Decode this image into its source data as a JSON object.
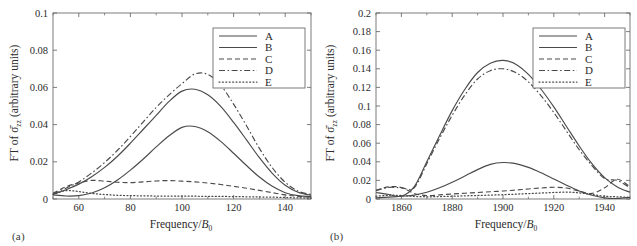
{
  "figure": {
    "background": "#ffffff",
    "line_color": "#4a4a4a",
    "axis_color": "#6e6e6e",
    "panels": [
      "a",
      "b"
    ]
  },
  "panel_a": {
    "caption": "(a)",
    "xlabel_main": "Frequency/",
    "xlabel_var": "B",
    "xlabel_sub": "0",
    "ylabel_prefix": "FT of ",
    "ylabel_sigma": "σ̄",
    "ylabel_sub": "zz",
    "ylabel_suffix": " (arbitrary units)",
    "xticks": [
      "60",
      "80",
      "100",
      "120",
      "140"
    ],
    "xtick_values": [
      60,
      80,
      100,
      120,
      140
    ],
    "yticks": [
      "0",
      "0.02",
      "0.04",
      "0.06",
      "0.08",
      "0.1"
    ],
    "ytick_values": [
      0,
      0.02,
      0.04,
      0.06,
      0.08,
      0.1
    ],
    "legend": [
      {
        "label": "A",
        "style": "solid"
      },
      {
        "label": "B",
        "style": "solid"
      },
      {
        "label": "C",
        "style": "dashed"
      },
      {
        "label": "D",
        "style": "dashdot"
      },
      {
        "label": "E",
        "style": "dotted"
      }
    ]
  },
  "panel_b": {
    "caption": "(b)",
    "xlabel_main": "Frequency/",
    "xlabel_var": "B",
    "xlabel_sub": "0",
    "ylabel_prefix": "FT of ",
    "ylabel_sigma": "σ̄",
    "ylabel_sub": "zz",
    "ylabel_suffix": " (arbitrary units)",
    "xticks": [
      "1860",
      "1880",
      "1900",
      "1920",
      "1940"
    ],
    "xtick_values": [
      1860,
      1880,
      1900,
      1920,
      1940
    ],
    "yticks": [
      "0",
      "0.02",
      "0.04",
      "0.06",
      "0.08",
      "0.1",
      "0.12",
      "0.14",
      "0.16",
      "0.18",
      "0.2"
    ],
    "ytick_values": [
      0,
      0.02,
      0.04,
      0.06,
      0.08,
      0.1,
      0.12,
      0.14,
      0.16,
      0.18,
      0.2
    ],
    "legend": [
      {
        "label": "A",
        "style": "solid"
      },
      {
        "label": "B",
        "style": "solid"
      },
      {
        "label": "C",
        "style": "dashed"
      },
      {
        "label": "D",
        "style": "dashdot"
      },
      {
        "label": "E",
        "style": "dotted"
      }
    ]
  },
  "chart_data": [
    {
      "type": "line",
      "panel": "a",
      "title": "",
      "xlabel": "Frequency/B0",
      "ylabel": "FT of σ̄zz (arbitrary units)",
      "xlim": [
        50,
        150
      ],
      "ylim": [
        0,
        0.1
      ],
      "grid": false,
      "legend_position": "top-right",
      "x": [
        50,
        55,
        60,
        65,
        70,
        75,
        80,
        85,
        90,
        95,
        100,
        105,
        110,
        115,
        120,
        125,
        130,
        135,
        140,
        145,
        150
      ],
      "series": [
        {
          "name": "A",
          "style": "solid",
          "values": [
            0.0022,
            0.0016,
            0.0018,
            0.0032,
            0.006,
            0.0102,
            0.0155,
            0.0215,
            0.028,
            0.034,
            0.0385,
            0.039,
            0.0362,
            0.031,
            0.0246,
            0.018,
            0.0118,
            0.0068,
            0.0034,
            0.0018,
            0.0014
          ]
        },
        {
          "name": "B",
          "style": "solid",
          "values": [
            0.0026,
            0.005,
            0.008,
            0.012,
            0.017,
            0.023,
            0.03,
            0.0375,
            0.045,
            0.0525,
            0.058,
            0.059,
            0.056,
            0.0498,
            0.0412,
            0.0318,
            0.0222,
            0.0138,
            0.0074,
            0.0036,
            0.002
          ]
        },
        {
          "name": "C",
          "style": "dashed",
          "values": [
            0.003,
            0.0066,
            0.0086,
            0.01,
            0.0096,
            0.009,
            0.0088,
            0.0092,
            0.0097,
            0.0099,
            0.0096,
            0.0092,
            0.0086,
            0.0078,
            0.0068,
            0.0058,
            0.0046,
            0.0034,
            0.0022,
            0.0014,
            0.001
          ]
        },
        {
          "name": "D",
          "style": "dashdot",
          "values": [
            0.0028,
            0.0058,
            0.0092,
            0.014,
            0.0196,
            0.0262,
            0.0336,
            0.0415,
            0.0492,
            0.056,
            0.062,
            0.0672,
            0.067,
            0.0612,
            0.051,
            0.0394,
            0.0272,
            0.0168,
            0.009,
            0.0042,
            0.0024
          ]
        },
        {
          "name": "E",
          "style": "dotted",
          "values": [
            0.0024,
            0.0045,
            0.004,
            0.003,
            0.0024,
            0.002,
            0.0018,
            0.0017,
            0.0016,
            0.0016,
            0.0015,
            0.0015,
            0.0014,
            0.0014,
            0.0013,
            0.0012,
            0.0011,
            0.001,
            0.0008,
            0.0006,
            0.0005
          ]
        }
      ]
    },
    {
      "type": "line",
      "panel": "b",
      "title": "",
      "xlabel": "Frequency/B0",
      "ylabel": "FT of σ̄zz (arbitrary units)",
      "xlim": [
        1850,
        1950
      ],
      "ylim": [
        0,
        0.2
      ],
      "grid": false,
      "legend_position": "top-right",
      "x": [
        1850,
        1855,
        1860,
        1865,
        1870,
        1875,
        1880,
        1885,
        1890,
        1895,
        1900,
        1905,
        1910,
        1915,
        1920,
        1925,
        1930,
        1935,
        1940,
        1945,
        1950
      ],
      "series": [
        {
          "name": "A",
          "style": "solid",
          "values": [
            0.0012,
            0.002,
            0.003,
            0.0042,
            0.0072,
            0.012,
            0.018,
            0.0248,
            0.0316,
            0.0372,
            0.0392,
            0.038,
            0.034,
            0.0282,
            0.0216,
            0.0148,
            0.0086,
            0.004,
            0.0012,
            0.0006,
            0.0018
          ]
        },
        {
          "name": "B",
          "style": "solid",
          "values": [
            0.007,
            0.0048,
            0.003,
            0.013,
            0.04,
            0.068,
            0.095,
            0.118,
            0.136,
            0.146,
            0.149,
            0.145,
            0.134,
            0.118,
            0.099,
            0.078,
            0.057,
            0.038,
            0.023,
            0.013,
            0.0072
          ]
        },
        {
          "name": "C",
          "style": "dashed",
          "values": [
            0.0095,
            0.013,
            0.0124,
            0.006,
            0.0036,
            0.0044,
            0.0054,
            0.0062,
            0.007,
            0.0078,
            0.0086,
            0.0096,
            0.0108,
            0.0118,
            0.0126,
            0.0118,
            0.0084,
            0.006,
            0.012,
            0.0212,
            0.013
          ]
        },
        {
          "name": "D",
          "style": "dashdot",
          "values": [
            0.009,
            0.0125,
            0.012,
            0.012,
            0.038,
            0.065,
            0.09,
            0.112,
            0.129,
            0.138,
            0.14,
            0.136,
            0.126,
            0.111,
            0.093,
            0.073,
            0.053,
            0.036,
            0.022,
            0.02,
            0.012
          ]
        },
        {
          "name": "E",
          "style": "dotted",
          "values": [
            0.003,
            0.004,
            0.0038,
            0.0028,
            0.0024,
            0.0026,
            0.003,
            0.0034,
            0.0038,
            0.0042,
            0.0046,
            0.0052,
            0.0058,
            0.0064,
            0.007,
            0.0074,
            0.0066,
            0.0048,
            0.003,
            0.0024,
            0.0018
          ]
        }
      ]
    }
  ]
}
